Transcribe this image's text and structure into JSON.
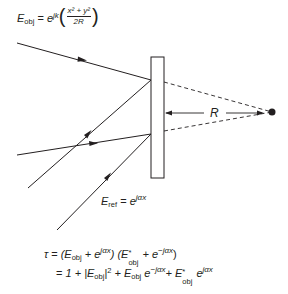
{
  "labels": {
    "e_obj": {
      "lhs_base": "E",
      "lhs_sub": "obj",
      "equals": "=",
      "base": "e",
      "exponent_prefix": "jk",
      "frac_num": "x² + y²",
      "frac_den": "2R",
      "paren_open": "(",
      "paren_close": ")"
    },
    "e_ref": {
      "lhs_base": "E",
      "lhs_sub": "ref",
      "equals": "=",
      "base": "e",
      "exponent": "jαx"
    },
    "distance": "R"
  },
  "equations": {
    "line1": {
      "lhs": "τ",
      "eq": "=",
      "p1": "(E",
      "sub1": "obj",
      "p2": " + e",
      "exp1": "jαx",
      "p3": ") (E",
      "star1": "*",
      "sub2": "obj",
      "p4": " + e",
      "exp2": "−jαx",
      "p5": ")"
    },
    "line2": {
      "eq": "=",
      "p1": "1 + |E",
      "sub1": "obj",
      "p2": "|",
      "sup1": "2",
      "p3": " + E",
      "sub2": "obj",
      "p4": " e",
      "exp1": "−jαx",
      "p5": "+ E",
      "star1": "*",
      "sub3": "obj",
      "p6": "  e",
      "exp2": "jαx"
    }
  },
  "geometry": {
    "plate": {
      "x": 151,
      "y": 57,
      "w": 13,
      "h": 121
    },
    "point_source": {
      "cx": 272,
      "cy": 112,
      "r": 3.5
    },
    "colors": {
      "ink": "#231f20",
      "background": "#ffffff"
    }
  }
}
